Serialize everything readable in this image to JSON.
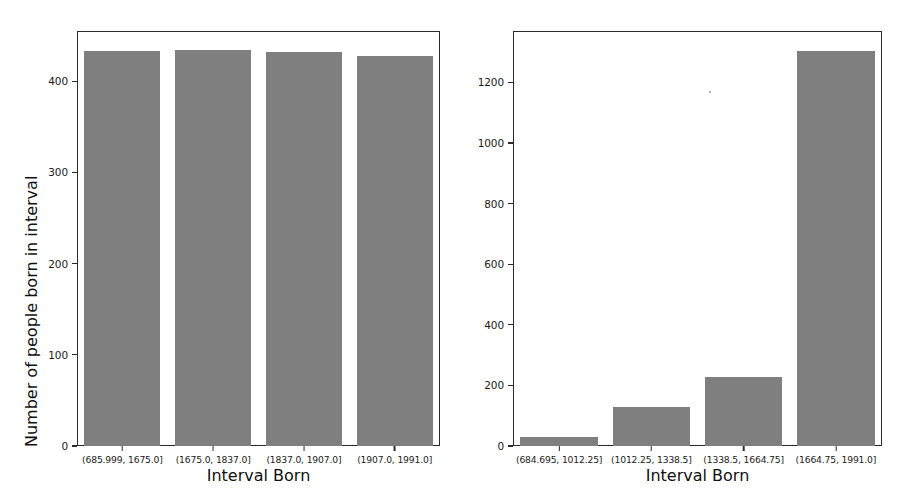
{
  "figure": {
    "background": "#ffffff",
    "bar_color": "#7f7f7f",
    "spine_color": "#2b2b2b"
  },
  "chart_data": [
    {
      "type": "bar",
      "title": "",
      "subtitle": "",
      "xlabel": "Interval Born",
      "ylabel": "Number of people born in interval",
      "categories": [
        "(685.999, 1675.0]",
        "(1675.0, 1837.0]",
        "(1837.0, 1907.0]",
        "(1907.0, 1991.0]"
      ],
      "values": [
        433,
        434,
        432,
        428
      ],
      "yticks": [
        0,
        100,
        200,
        300,
        400
      ],
      "ytick_labels": [
        "0",
        "100",
        "200",
        "300",
        "400"
      ],
      "ylim": [
        0,
        455
      ],
      "xlim": [
        0,
        4
      ],
      "grid": false,
      "legend": null,
      "legend_position": "none",
      "bar_width_fraction": 0.84
    },
    {
      "type": "bar",
      "title": "",
      "subtitle": "",
      "xlabel": "Interval Born",
      "ylabel": "",
      "categories": [
        "(684.695, 1012.25]",
        "(1012.25, 1338.5]",
        "(1338.5, 1664.75]",
        "(1664.75, 1991.0]"
      ],
      "values": [
        31,
        130,
        227,
        1303
      ],
      "yticks": [
        0,
        200,
        400,
        600,
        800,
        1000,
        1200
      ],
      "ytick_labels": [
        "0",
        "200",
        "400",
        "600",
        "800",
        "1000",
        "1200"
      ],
      "ylim": [
        0,
        1370
      ],
      "xlim": [
        0,
        4
      ],
      "grid": false,
      "legend": null,
      "legend_position": "none",
      "bar_width_fraction": 0.84
    }
  ]
}
